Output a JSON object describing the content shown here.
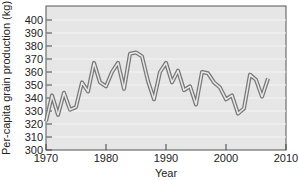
{
  "chart_data": {
    "type": "line",
    "title": "",
    "xlabel": "Year",
    "ylabel": "Per-capita grain production (kg)",
    "xlim": [
      1970,
      2010
    ],
    "ylim": [
      300,
      410
    ],
    "xticks": [
      1970,
      1980,
      1990,
      2000,
      2010
    ],
    "yticks": [
      300,
      310,
      320,
      330,
      340,
      350,
      360,
      370,
      380,
      390,
      400
    ],
    "grid": true,
    "legend": null,
    "series": [
      {
        "name": "Per-capita grain production",
        "x": [
          1970,
          1971,
          1972,
          1973,
          1974,
          1975,
          1976,
          1977,
          1978,
          1979,
          1980,
          1981,
          1982,
          1983,
          1984,
          1985,
          1986,
          1987,
          1988,
          1989,
          1990,
          1991,
          1992,
          1993,
          1994,
          1995,
          1996,
          1997,
          1998,
          1999,
          2000,
          2001,
          2002,
          2003,
          2004,
          2005,
          2006,
          2007
        ],
        "values": [
          322,
          342,
          327,
          344,
          331,
          333,
          352,
          345,
          367,
          352,
          349,
          360,
          367,
          347,
          374,
          375,
          372,
          353,
          339,
          360,
          367,
          352,
          361,
          346,
          349,
          335,
          360,
          359,
          352,
          348,
          339,
          342,
          328,
          332,
          358,
          354,
          341,
          355
        ]
      }
    ]
  }
}
